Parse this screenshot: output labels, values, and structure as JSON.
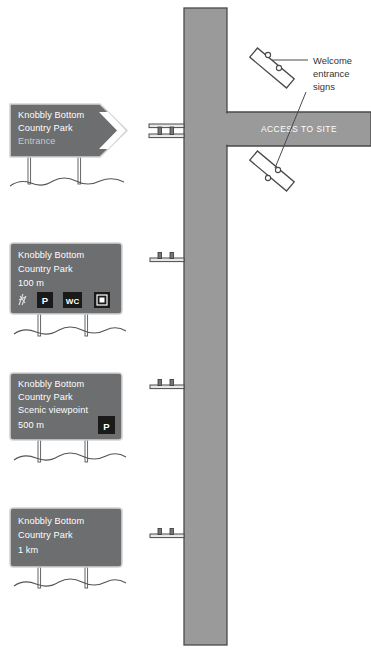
{
  "diagram": {
    "colors": {
      "sign_face": "#6d6e70",
      "sign_border": "#d4d4d4",
      "road_fill": "#9a9a9a",
      "road_stroke": "#4a4a4a",
      "sign_text": "#ffffff",
      "faded_text": "#c9c9c9",
      "callout_text": "#333333",
      "pictogram_bg": "#1a1a1a",
      "post": "#ffffff",
      "ground_line": "#555555"
    }
  },
  "road": {
    "main_label": "",
    "access_label": "ACCESS TO SITE"
  },
  "callout": {
    "line1": "Welcome",
    "line2": "entrance",
    "line3": "signs"
  },
  "signs": [
    {
      "id": "sign-entrance",
      "name": "entrance-sign",
      "lines": [
        {
          "text": "Knobbly Bottom",
          "faded": false
        },
        {
          "text": "Country Park",
          "faded": false
        },
        {
          "text": "Entrance",
          "faded": true
        }
      ],
      "has_arrow": true,
      "pictograms": []
    },
    {
      "id": "sign-100m",
      "name": "distance-sign-100m",
      "lines": [
        {
          "text": "Knobbly Bottom",
          "faded": false
        },
        {
          "text": "Country Park",
          "faded": false
        },
        {
          "text": "100 m",
          "faded": false
        }
      ],
      "has_arrow": false,
      "pictograms": [
        "picnic-icon",
        "parking-icon",
        "toilets-icon",
        "information-icon"
      ]
    },
    {
      "id": "sign-500m",
      "name": "scenic-viewpoint-sign-500m",
      "lines": [
        {
          "text": "Knobbly Bottom",
          "faded": false
        },
        {
          "text": "Country Park",
          "faded": false
        },
        {
          "text": "Scenic viewpoint",
          "faded": false
        },
        {
          "text": "500 m",
          "faded": false
        }
      ],
      "has_arrow": false,
      "pictograms": [
        "parking-icon"
      ]
    },
    {
      "id": "sign-1km",
      "name": "distance-sign-1km",
      "lines": [
        {
          "text": "Knobbly Bottom",
          "faded": false
        },
        {
          "text": "Country Park",
          "faded": false
        },
        {
          "text": "1 km",
          "faded": false
        }
      ],
      "has_arrow": false,
      "pictograms": []
    }
  ],
  "pictogram_labels": {
    "parking": "P",
    "toilets": "WC"
  },
  "roadside_markers": [
    {
      "name": "roadside-sign-marker-1",
      "bars": 2
    },
    {
      "name": "roadside-sign-marker-2",
      "bars": 1
    },
    {
      "name": "roadside-sign-marker-3",
      "bars": 1
    },
    {
      "name": "roadside-sign-marker-4",
      "bars": 1
    }
  ],
  "welcome_signs": [
    {
      "name": "welcome-sign-upper"
    },
    {
      "name": "welcome-sign-lower"
    }
  ]
}
